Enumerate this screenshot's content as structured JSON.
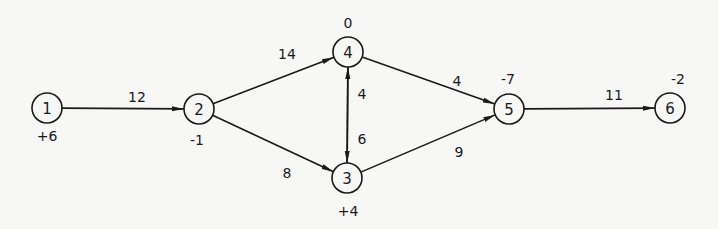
{
  "diagram": {
    "type": "network-flow",
    "colors": {
      "background": "#f7f7f5",
      "ink": "#1a1a1a"
    },
    "nodes": [
      {
        "id": "1",
        "label": "1",
        "supply": "+6",
        "x": 47,
        "y": 108,
        "supply_x": 47,
        "supply_y": 136
      },
      {
        "id": "2",
        "label": "2",
        "supply": "-1",
        "x": 199,
        "y": 109,
        "supply_x": 197,
        "supply_y": 140
      },
      {
        "id": "3",
        "label": "3",
        "supply": "+4",
        "x": 347,
        "y": 178,
        "supply_x": 348,
        "supply_y": 211
      },
      {
        "id": "4",
        "label": "4",
        "supply": "0",
        "x": 348,
        "y": 52,
        "supply_x": 348,
        "supply_y": 23
      },
      {
        "id": "5",
        "label": "5",
        "supply": "-7",
        "x": 509,
        "y": 109,
        "supply_x": 508,
        "supply_y": 79
      },
      {
        "id": "6",
        "label": "6",
        "supply": "-2",
        "x": 670,
        "y": 108,
        "supply_x": 678,
        "supply_y": 79
      }
    ],
    "edges": [
      {
        "from": "1",
        "to": "2",
        "label": "12",
        "label_x": 137,
        "label_y": 97
      },
      {
        "from": "2",
        "to": "4",
        "label": "14",
        "label_x": 287,
        "label_y": 54
      },
      {
        "from": "2",
        "to": "3",
        "label": "8",
        "label_x": 287,
        "label_y": 173
      },
      {
        "from": "3",
        "to": "4",
        "label": "4",
        "label_x": 362,
        "label_y": 94
      },
      {
        "from": "4",
        "to": "3",
        "label": "6",
        "label_x": 362,
        "label_y": 139
      },
      {
        "from": "4",
        "to": "5",
        "label": "4",
        "label_x": 457,
        "label_y": 81
      },
      {
        "from": "3",
        "to": "5",
        "label": "9",
        "label_x": 459,
        "label_y": 152
      },
      {
        "from": "5",
        "to": "6",
        "label": "11",
        "label_x": 614,
        "label_y": 95
      }
    ]
  }
}
